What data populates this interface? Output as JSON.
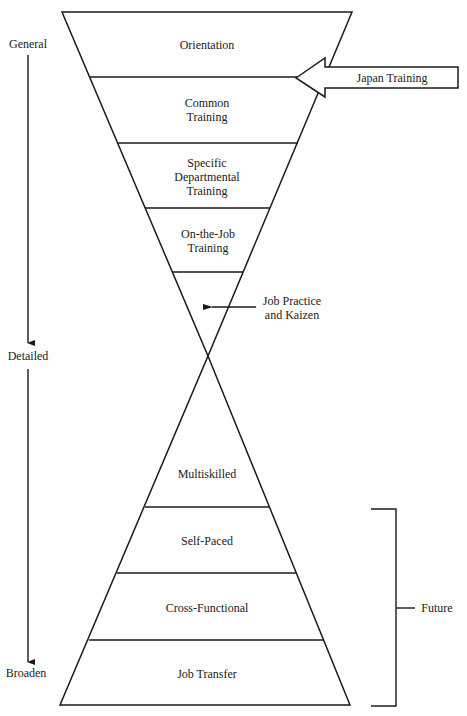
{
  "diagram": {
    "axis_labels": {
      "top": "General",
      "middle": "Detailed",
      "bottom": "Broaden"
    },
    "upper_funnel": [
      {
        "lines": [
          "Orientation"
        ]
      },
      {
        "lines": [
          "Common",
          "Training"
        ]
      },
      {
        "lines": [
          "Specific",
          "Departmental",
          "Training"
        ]
      },
      {
        "lines": [
          "On-the-Job",
          "Training"
        ]
      }
    ],
    "lower_pyramid": [
      {
        "lines": [
          "Multiskilled"
        ]
      },
      {
        "lines": [
          "Self-Paced"
        ]
      },
      {
        "lines": [
          "Cross-Functional"
        ]
      },
      {
        "lines": [
          "Job Transfer"
        ]
      }
    ],
    "callouts": {
      "japan_training": "Japan Training",
      "job_practice": [
        "Job Practice",
        "and Kaizen"
      ],
      "future": "Future"
    }
  }
}
